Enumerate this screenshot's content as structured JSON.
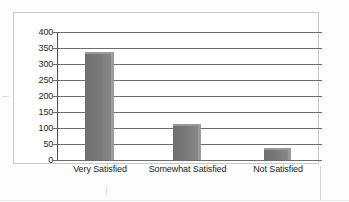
{
  "chart_data": {
    "type": "bar",
    "title": "",
    "subtitle": "",
    "xlabel": "",
    "ylabel": "",
    "categories": [
      "Very Satisfied",
      "Somewhat Satisfied",
      "Not Satisfied"
    ],
    "values": [
      338,
      113,
      38
    ],
    "ylim": [
      0,
      400
    ],
    "ytick_step": 50,
    "yticks": [
      "400",
      "350",
      "300",
      "250",
      "200",
      "150",
      "100",
      "50",
      "0"
    ],
    "ytick_values": [
      400,
      350,
      300,
      250,
      200,
      150,
      100,
      50,
      0
    ],
    "grid": "horizontal",
    "legend": "none",
    "bar_color": "#7b7b7b",
    "bar_edge_color": "#9b9b9b",
    "axis_color": "#4a4a4a",
    "gridline_color": "#6d6d6d",
    "text_color": "#1d1d1d",
    "frame_color": "#c9c9c9",
    "background": "#ffffff",
    "annotations": []
  }
}
